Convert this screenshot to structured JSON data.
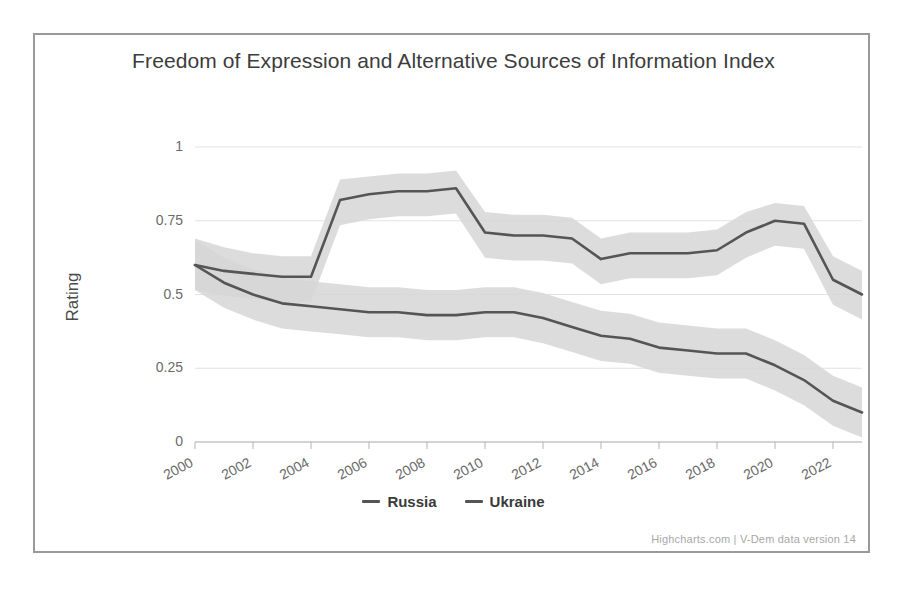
{
  "chart_data": {
    "type": "line",
    "title": "Freedom of Expression and Alternative Sources of Information Index",
    "xlabel": "",
    "ylabel": "Rating",
    "ylim": [
      0,
      1
    ],
    "xlim": [
      2000,
      2023
    ],
    "grid": true,
    "legend_position": "bottom-center",
    "y_ticks": [
      "0",
      "0.25",
      "0.5",
      "0.75",
      "1"
    ],
    "y_tick_values": [
      0,
      0.25,
      0.5,
      0.75,
      1
    ],
    "x_ticks": [
      "2000",
      "2002",
      "2004",
      "2006",
      "2008",
      "2010",
      "2012",
      "2014",
      "2016",
      "2018",
      "2020",
      "2022"
    ],
    "x_tick_values": [
      2000,
      2002,
      2004,
      2006,
      2008,
      2010,
      2012,
      2014,
      2016,
      2018,
      2020,
      2022
    ],
    "x": [
      2000,
      2001,
      2002,
      2003,
      2004,
      2005,
      2006,
      2007,
      2008,
      2009,
      2010,
      2011,
      2012,
      2013,
      2014,
      2015,
      2016,
      2017,
      2018,
      2019,
      2020,
      2021,
      2022,
      2023
    ],
    "series": [
      {
        "name": "Russia",
        "color": "#555555",
        "values": [
          0.6,
          0.54,
          0.5,
          0.47,
          0.46,
          0.45,
          0.44,
          0.44,
          0.43,
          0.43,
          0.44,
          0.44,
          0.42,
          0.39,
          0.36,
          0.35,
          0.32,
          0.31,
          0.3,
          0.3,
          0.29,
          0.28,
          0.27,
          0.26
        ],
        "band_upper": [
          0.69,
          0.63,
          0.58,
          0.55,
          0.53,
          0.52,
          0.51,
          0.51,
          0.5,
          0.5,
          0.51,
          0.51,
          0.49,
          0.46,
          0.43,
          0.42,
          0.39,
          0.38,
          0.37,
          0.37,
          0.36,
          0.35,
          0.34,
          0.33
        ],
        "band_lower": [
          0.51,
          0.45,
          0.42,
          0.39,
          0.38,
          0.37,
          0.36,
          0.36,
          0.35,
          0.35,
          0.36,
          0.36,
          0.34,
          0.32,
          0.29,
          0.28,
          0.25,
          0.24,
          0.23,
          0.23,
          0.22,
          0.21,
          0.2,
          0.19
        ]
      },
      {
        "name": "Ukraine",
        "color": "#555555",
        "values": [
          0.6,
          0.58,
          0.57,
          0.56,
          0.56,
          0.82,
          0.84,
          0.85,
          0.85,
          0.86,
          0.71,
          0.7,
          0.7,
          0.69,
          0.62,
          0.64,
          0.64,
          0.64,
          0.65,
          0.71,
          0.75,
          0.74,
          0.55,
          0.5
        ],
        "band_upper": [
          0.69,
          0.66,
          0.64,
          0.63,
          0.63,
          0.89,
          0.9,
          0.91,
          0.91,
          0.92,
          0.78,
          0.77,
          0.77,
          0.76,
          0.69,
          0.71,
          0.71,
          0.71,
          0.72,
          0.78,
          0.81,
          0.8,
          0.63,
          0.58
        ]
      }
    ],
    "band_note": "shaded uncertainty interval",
    "russia_values_tail": [
      0.26,
      0.21,
      0.14,
      0.1
    ],
    "russia_x_tail": [
      2020,
      2021,
      2022,
      2023
    ]
  },
  "credits": {
    "text": "Highcharts.com | V-Dem data version 14"
  },
  "style": {
    "line_color": "#555555",
    "band_color": "#d6d6d6",
    "grid_color": "#e2e2e2",
    "axis_color": "#b5b5b5",
    "border_color": "#9a9a9a",
    "title_color": "#3c3c3c",
    "tick_color": "#6b6b6b"
  }
}
